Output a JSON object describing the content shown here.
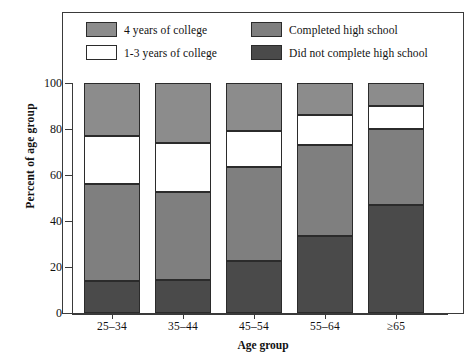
{
  "chart_data": {
    "type": "bar",
    "subtype": "stacked-percent",
    "title": "",
    "xlabel": "Age group",
    "ylabel": "Percent of age group",
    "categories": [
      "25–34",
      "35–44",
      "45–54",
      "55–64",
      "≥65"
    ],
    "ylim": [
      0,
      100
    ],
    "yticks": [
      0,
      20,
      40,
      60,
      80,
      100
    ],
    "ytick_labels": [
      "0",
      "20",
      "40",
      "60",
      "80",
      "100"
    ],
    "grid": false,
    "legend_position": "top-inside",
    "series": [
      {
        "name": "Did not complete high school",
        "color": "#4a4a4a",
        "values": [
          14,
          14.5,
          22.5,
          33.5,
          47
        ]
      },
      {
        "name": "Completed high school",
        "color": "#7f7f7f",
        "values": [
          42,
          38,
          41,
          39.5,
          33
        ]
      },
      {
        "name": "1-3 years of college",
        "color": "#ffffff",
        "values": [
          21,
          21.5,
          15.5,
          13,
          10
        ]
      },
      {
        "name": "4 years of college",
        "color": "#8c8c8c",
        "values": [
          23,
          26,
          21,
          14,
          10
        ]
      }
    ],
    "cumulative_tops": [
      [
        14,
        56,
        77,
        100
      ],
      [
        14.5,
        52.5,
        74,
        100
      ],
      [
        22.5,
        63.5,
        79,
        100
      ],
      [
        33.5,
        73,
        86,
        100
      ],
      [
        47,
        80,
        90,
        100
      ]
    ]
  },
  "legend": {
    "items": [
      {
        "label": "4 years of college",
        "color": "#8c8c8c",
        "swatch": "gray-swatch"
      },
      {
        "label": "Completed high school",
        "color": "#7f7f7f",
        "swatch": "gray-swatch"
      },
      {
        "label": "1-3 years of college",
        "color": "#ffffff",
        "swatch": "white-swatch"
      },
      {
        "label": "Did not complete high school",
        "color": "#4a4a4a",
        "swatch": "dark-swatch"
      }
    ]
  },
  "axes": {
    "y_title": "Percent of age group",
    "x_title": "Age group",
    "y_labels": [
      "100",
      "80",
      "60",
      "40",
      "20",
      "0"
    ],
    "x_labels": [
      "25–34",
      "35–44",
      "45–54",
      "55–64",
      "≥65"
    ]
  },
  "colors": {
    "four_year_college": "#8c8c8c",
    "completed_high_school": "#7f7f7f",
    "one_three_college": "#ffffff",
    "not_completed_high_school": "#4a4a4a",
    "frame": "#3a3a3a",
    "background": "#ffffff"
  }
}
